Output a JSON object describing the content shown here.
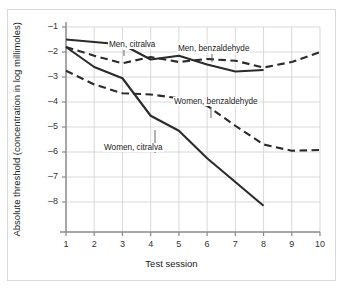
{
  "figure": {
    "background_color": "#ffffff",
    "frame_color": "#d9d9d9"
  },
  "chart_data": {
    "type": "line",
    "title": "",
    "xlabel": "Test session",
    "ylabel": "Absolute threshold (concentration in log millimoles)",
    "xlim": [
      1,
      10
    ],
    "ylim": [
      -8.6,
      -0.8
    ],
    "xticks": [
      "1",
      "2",
      "3",
      "4",
      "5",
      "6",
      "7",
      "8",
      "9",
      "10"
    ],
    "yticks": [
      "–1",
      "–2",
      "–3",
      "–4",
      "–5",
      "–6",
      "–7",
      "–8"
    ],
    "ytick_values": [
      -1,
      -2,
      -3,
      -4,
      -5,
      -6,
      -7,
      -8
    ],
    "grid": true,
    "grid_color": "#cfcfcf",
    "legend_position": "inline-annotations",
    "line_color": "#2b2b2b",
    "series": [
      {
        "name": "Men, citralva",
        "style": "solid",
        "label": "Men, citralva",
        "x": [
          1,
          2,
          3,
          4,
          5,
          6,
          7,
          8
        ],
        "values": [
          -1.5,
          -1.6,
          -1.7,
          -2.3,
          -2.15,
          -2.5,
          -2.78,
          -2.72
        ]
      },
      {
        "name": "Men, benzaldehyde",
        "style": "dashed",
        "label": "Men, benzaldehyde",
        "x": [
          1,
          2,
          3,
          4,
          5,
          6,
          7,
          8,
          9,
          10
        ],
        "values": [
          -1.8,
          -2.15,
          -2.45,
          -2.2,
          -2.4,
          -2.28,
          -2.35,
          -2.62,
          -2.4,
          -2.0
        ]
      },
      {
        "name": "Women, benzaldehyde",
        "style": "dashed",
        "label": "Women, benzaldehyde",
        "x": [
          1,
          2,
          3,
          4,
          5,
          6,
          7,
          8,
          9,
          10
        ],
        "values": [
          -2.75,
          -3.3,
          -3.65,
          -3.7,
          -3.85,
          -4.15,
          -4.95,
          -5.7,
          -5.95,
          -5.92
        ]
      },
      {
        "name": "Women, citralva",
        "style": "solid",
        "label": "Women, citralva",
        "x": [
          1,
          2,
          3,
          4,
          5,
          6,
          7,
          8
        ],
        "values": [
          -1.8,
          -2.6,
          -3.05,
          -4.55,
          -5.15,
          -6.25,
          -7.2,
          -8.15
        ]
      }
    ],
    "annotations": [
      {
        "text": "Men, citralva",
        "x_px": 108,
        "y_px": 40,
        "leader_to_x": 124,
        "leader_to_y": 56
      },
      {
        "text": "Men, benzaldehyde",
        "x_px": 177,
        "y_px": 44,
        "leader_to_x": 212,
        "leader_to_y": 62
      },
      {
        "text": "Women, benzaldehyde",
        "x_px": 173,
        "y_px": 97,
        "leader_to_x": 211,
        "leader_to_y": 118
      },
      {
        "text": "Women, citralva",
        "x_px": 103,
        "y_px": 143,
        "leader_to_x": 155,
        "leader_to_y": 130
      }
    ]
  }
}
